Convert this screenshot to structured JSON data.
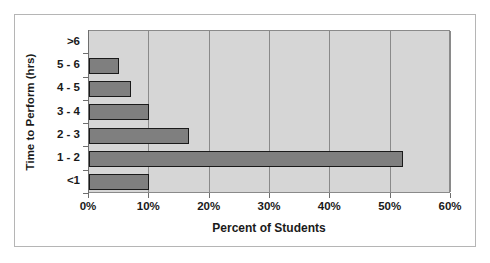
{
  "chart_data": {
    "type": "bar",
    "orientation": "horizontal",
    "title": "",
    "xlabel": "Percent of Students",
    "ylabel": "Time to Perform (hrs)",
    "categories": [
      ">6",
      "5 - 6",
      "4 - 5",
      "3 - 4",
      "2 - 3",
      "1 - 2",
      "<1"
    ],
    "values": [
      0,
      5,
      7,
      10,
      16.5,
      52,
      10
    ],
    "xlim": [
      0,
      60
    ],
    "xtick_labels": [
      "0%",
      "10%",
      "20%",
      "30%",
      "40%",
      "50%",
      "60%"
    ],
    "xticks": [
      0,
      10,
      20,
      30,
      40,
      50,
      60
    ],
    "grid": "vertical",
    "legend": "none",
    "colors": {
      "bar_fill": "#7f7f7f",
      "bar_edge": "#1a1a1a",
      "plot_background": "#d6d6d6",
      "gridline": "#8a8a8a",
      "figure_background": "#ffffff",
      "frame": "#b5b5b5",
      "text": "#1a1a1a"
    }
  }
}
